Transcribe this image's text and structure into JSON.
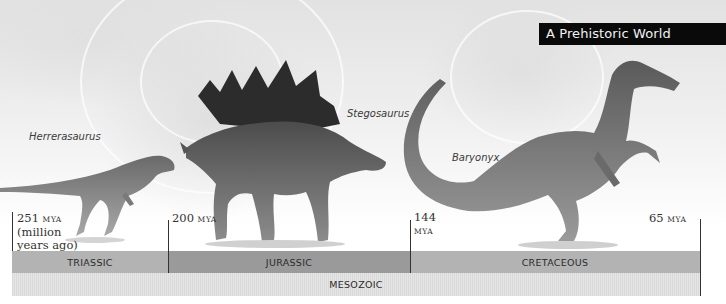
{
  "title": "A Prehistoric World",
  "dinosaurs": [
    {
      "name": "Herrerasaurus",
      "period": "Triassic"
    },
    {
      "name": "Stegosaurus",
      "period": "Jurassic"
    },
    {
      "name": "Baryonyx",
      "period": "Cretaceous"
    }
  ],
  "timeline": {
    "markers": [
      {
        "value": "251",
        "unit": "MYA",
        "note_line1": "(million",
        "note_line2": "years ago)"
      },
      {
        "value": "200",
        "unit": "MYA"
      },
      {
        "value": "144",
        "unit": "MYA"
      },
      {
        "value": "65",
        "unit": "MYA"
      }
    ],
    "periods": [
      {
        "label": "TRIASSIC",
        "color": "#b3b3b3"
      },
      {
        "label": "JURASSIC",
        "color": "#9a9a9a"
      },
      {
        "label": "CRETACEOUS",
        "color": "#b3b3b3"
      }
    ],
    "era": {
      "label": "MESOZOIC",
      "color": "#e0e0e0"
    }
  },
  "colors": {
    "title_bg": "#0a0a0a",
    "title_text": "#f2f2f2",
    "tick_line": "#333333"
  }
}
